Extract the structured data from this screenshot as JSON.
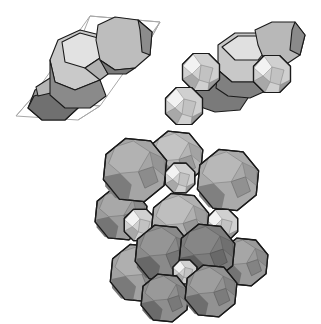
{
  "figure": {
    "width": 321,
    "height": 324,
    "background": "#ffffff",
    "edge_color": "#1a1a1a",
    "cell_edge_color": "#a8a8a8",
    "panels": [
      {
        "id": "panel-unit-cell",
        "description": "Two truncated octahedra inside a rhombohedral unit cell outline",
        "cell_outline": [
          [
            [
              90,
              16
            ],
            [
              160,
              22
            ],
            [
              100,
              106
            ],
            [
              30,
              100
            ]
          ],
          [
            [
              30,
              100
            ],
            [
              100,
              106
            ],
            [
              78,
              120
            ],
            [
              16,
              116
            ]
          ],
          [
            [
              90,
              16
            ],
            [
              160,
              22
            ],
            [
              150,
              40
            ],
            [
              82,
              36
            ]
          ],
          [
            [
              16,
              116
            ],
            [
              30,
              100
            ]
          ],
          [
            [
              78,
              120
            ],
            [
              100,
              106
            ]
          ],
          [
            [
              160,
              22
            ],
            [
              150,
              40
            ]
          ]
        ],
        "shapes": [
          {
            "type": "poly",
            "fill": "#9a9a9a",
            "points": [
              [
                35,
                90
              ],
              [
                55,
                80
              ],
              [
                75,
                88
              ],
              [
                78,
                108
              ],
              [
                65,
                120
              ],
              [
                42,
                120
              ],
              [
                28,
                108
              ]
            ]
          },
          {
            "type": "poly",
            "fill": "#707070",
            "points": [
              [
                28,
                108
              ],
              [
                42,
                120
              ],
              [
                65,
                120
              ],
              [
                78,
                108
              ],
              [
                75,
                92
              ],
              [
                55,
                90
              ],
              [
                34,
                96
              ]
            ]
          },
          {
            "type": "poly",
            "fill": "#b5b5b5",
            "points": [
              [
                36,
                87
              ],
              [
                50,
                78
              ],
              [
                62,
                80
              ],
              [
                55,
                92
              ],
              [
                38,
                96
              ]
            ]
          },
          {
            "type": "poly",
            "fill": "#c9c9c9",
            "points": [
              [
                58,
                40
              ],
              [
                80,
                30
              ],
              [
                100,
                35
              ],
              [
                106,
                60
              ],
              [
                100,
                80
              ],
              [
                75,
                90
              ],
              [
                55,
                82
              ],
              [
                50,
                60
              ]
            ]
          },
          {
            "type": "poly",
            "fill": "#e2e2e2",
            "points": [
              [
                62,
                42
              ],
              [
                80,
                33
              ],
              [
                98,
                38
              ],
              [
                100,
                58
              ],
              [
                85,
                68
              ],
              [
                65,
                62
              ]
            ]
          },
          {
            "type": "poly",
            "fill": "#8a8a8a",
            "points": [
              [
                50,
                60
              ],
              [
                55,
                82
              ],
              [
                75,
                90
              ],
              [
                100,
                80
              ],
              [
                106,
                96
              ],
              [
                90,
                108
              ],
              [
                65,
                108
              ],
              [
                50,
                95
              ]
            ]
          },
          {
            "type": "poly",
            "fill": "#b0b0b0",
            "points": [
              [
                85,
                68
              ],
              [
                100,
                58
              ],
              [
                108,
                74
              ],
              [
                100,
                80
              ]
            ]
          },
          {
            "type": "poly",
            "fill": "#bdbdbd",
            "points": [
              [
                98,
                25
              ],
              [
                115,
                17
              ],
              [
                138,
                20
              ],
              [
                152,
                32
              ],
              [
                150,
                55
              ],
              [
                135,
                68
              ],
              [
                115,
                70
              ],
              [
                100,
                60
              ],
              [
                96,
                40
              ]
            ]
          },
          {
            "type": "poly",
            "fill": "#8c8c8c",
            "points": [
              [
                138,
                20
              ],
              [
                152,
                32
              ],
              [
                150,
                55
              ],
              [
                142,
                52
              ],
              [
                140,
                30
              ]
            ]
          },
          {
            "type": "poly",
            "fill": "#7a7a7a",
            "points": [
              [
                100,
                60
              ],
              [
                115,
                70
              ],
              [
                135,
                68
              ],
              [
                126,
                74
              ],
              [
                108,
                74
              ]
            ]
          }
        ]
      },
      {
        "id": "panel-octahedra",
        "description": "Truncated octahedra chain with cuboctahedra attached",
        "shapes": [
          {
            "type": "poly",
            "fill": "#7a7a7a",
            "points": [
              [
                190,
                92
              ],
              [
                210,
                82
              ],
              [
                235,
                84
              ],
              [
                250,
                95
              ],
              [
                240,
                110
              ],
              [
                215,
                112
              ],
              [
                195,
                105
              ]
            ]
          },
          {
            "type": "poly",
            "fill": "#c8c8c8",
            "points": [
              [
                218,
                45
              ],
              [
                235,
                33
              ],
              [
                258,
                33
              ],
              [
                272,
                45
              ],
              [
                270,
                70
              ],
              [
                255,
                82
              ],
              [
                232,
                82
              ],
              [
                218,
                70
              ]
            ]
          },
          {
            "type": "poly",
            "fill": "#e0e0e0",
            "points": [
              [
                222,
                47
              ],
              [
                238,
                36
              ],
              [
                258,
                36
              ],
              [
                268,
                48
              ],
              [
                258,
                60
              ],
              [
                235,
                60
              ]
            ]
          },
          {
            "type": "poly",
            "fill": "#808080",
            "points": [
              [
                218,
                70
              ],
              [
                232,
                82
              ],
              [
                255,
                82
              ],
              [
                270,
                70
              ],
              [
                268,
                90
              ],
              [
                250,
                98
              ],
              [
                228,
                96
              ],
              [
                216,
                88
              ]
            ]
          },
          {
            "type": "poly",
            "fill": "#b8b8b8",
            "points": [
              [
                255,
                30
              ],
              [
                272,
                22
              ],
              [
                295,
                22
              ],
              [
                305,
                35
              ],
              [
                300,
                55
              ],
              [
                285,
                65
              ],
              [
                265,
                62
              ],
              [
                258,
                45
              ]
            ]
          },
          {
            "type": "poly",
            "fill": "#8a8a8a",
            "points": [
              [
                295,
                22
              ],
              [
                305,
                35
              ],
              [
                300,
                55
              ],
              [
                290,
                50
              ],
              [
                292,
                30
              ]
            ]
          },
          {
            "type": "oct",
            "cx": 201,
            "cy": 72,
            "r": 20
          },
          {
            "type": "oct",
            "cx": 272,
            "cy": 74,
            "r": 20
          },
          {
            "type": "oct",
            "cx": 184,
            "cy": 106,
            "r": 20
          }
        ]
      },
      {
        "id": "panel-packing",
        "description": "Space-filling packing of truncated octahedra and cuboctahedra",
        "shapes": [
          {
            "type": "to",
            "cx": 176,
            "cy": 158,
            "r": 28,
            "fill": "#b5b5b5"
          },
          {
            "type": "oct",
            "cx": 180,
            "cy": 178,
            "r": 16
          },
          {
            "type": "to",
            "cx": 121,
            "cy": 214,
            "r": 27,
            "fill": "#9c9c9c"
          },
          {
            "type": "to",
            "cx": 228,
            "cy": 180,
            "r": 32,
            "fill": "#aaaaaa"
          },
          {
            "type": "to",
            "cx": 135,
            "cy": 170,
            "r": 33,
            "fill": "#a5a5a5"
          },
          {
            "type": "oct",
            "cx": 140,
            "cy": 225,
            "r": 17
          },
          {
            "type": "oct",
            "cx": 222,
            "cy": 225,
            "r": 17
          },
          {
            "type": "to",
            "cx": 180,
            "cy": 222,
            "r": 30,
            "fill": "#b0b0b0"
          },
          {
            "type": "to",
            "cx": 244,
            "cy": 262,
            "r": 25,
            "fill": "#9a9a9a"
          },
          {
            "type": "to",
            "cx": 139,
            "cy": 273,
            "r": 30,
            "fill": "#a2a2a2"
          },
          {
            "type": "to",
            "cx": 163,
            "cy": 253,
            "r": 29,
            "fill": "#8a8a8a"
          },
          {
            "type": "to",
            "cx": 207,
            "cy": 252,
            "r": 29,
            "fill": "#7c7c7c"
          },
          {
            "type": "oct",
            "cx": 185,
            "cy": 272,
            "r": 13
          },
          {
            "type": "to",
            "cx": 165,
            "cy": 298,
            "r": 25,
            "fill": "#8e8e8e"
          },
          {
            "type": "to",
            "cx": 211,
            "cy": 291,
            "r": 27,
            "fill": "#929292"
          }
        ]
      }
    ]
  }
}
